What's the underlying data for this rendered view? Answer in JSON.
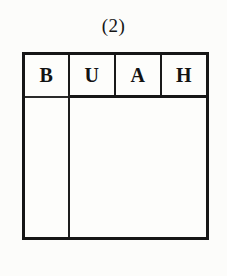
{
  "figure": {
    "caption": "(2)",
    "type": "hand-drawn-table-diagram",
    "ink_color": "#161616",
    "paper_color": "#fdfdfb"
  },
  "table": {
    "header_cells": [
      {
        "label": "B"
      },
      {
        "label": "U"
      },
      {
        "label": "A"
      },
      {
        "label": "H"
      }
    ],
    "body_rows": [],
    "body_left_column_empty": true,
    "body_right_column_empty": true
  }
}
